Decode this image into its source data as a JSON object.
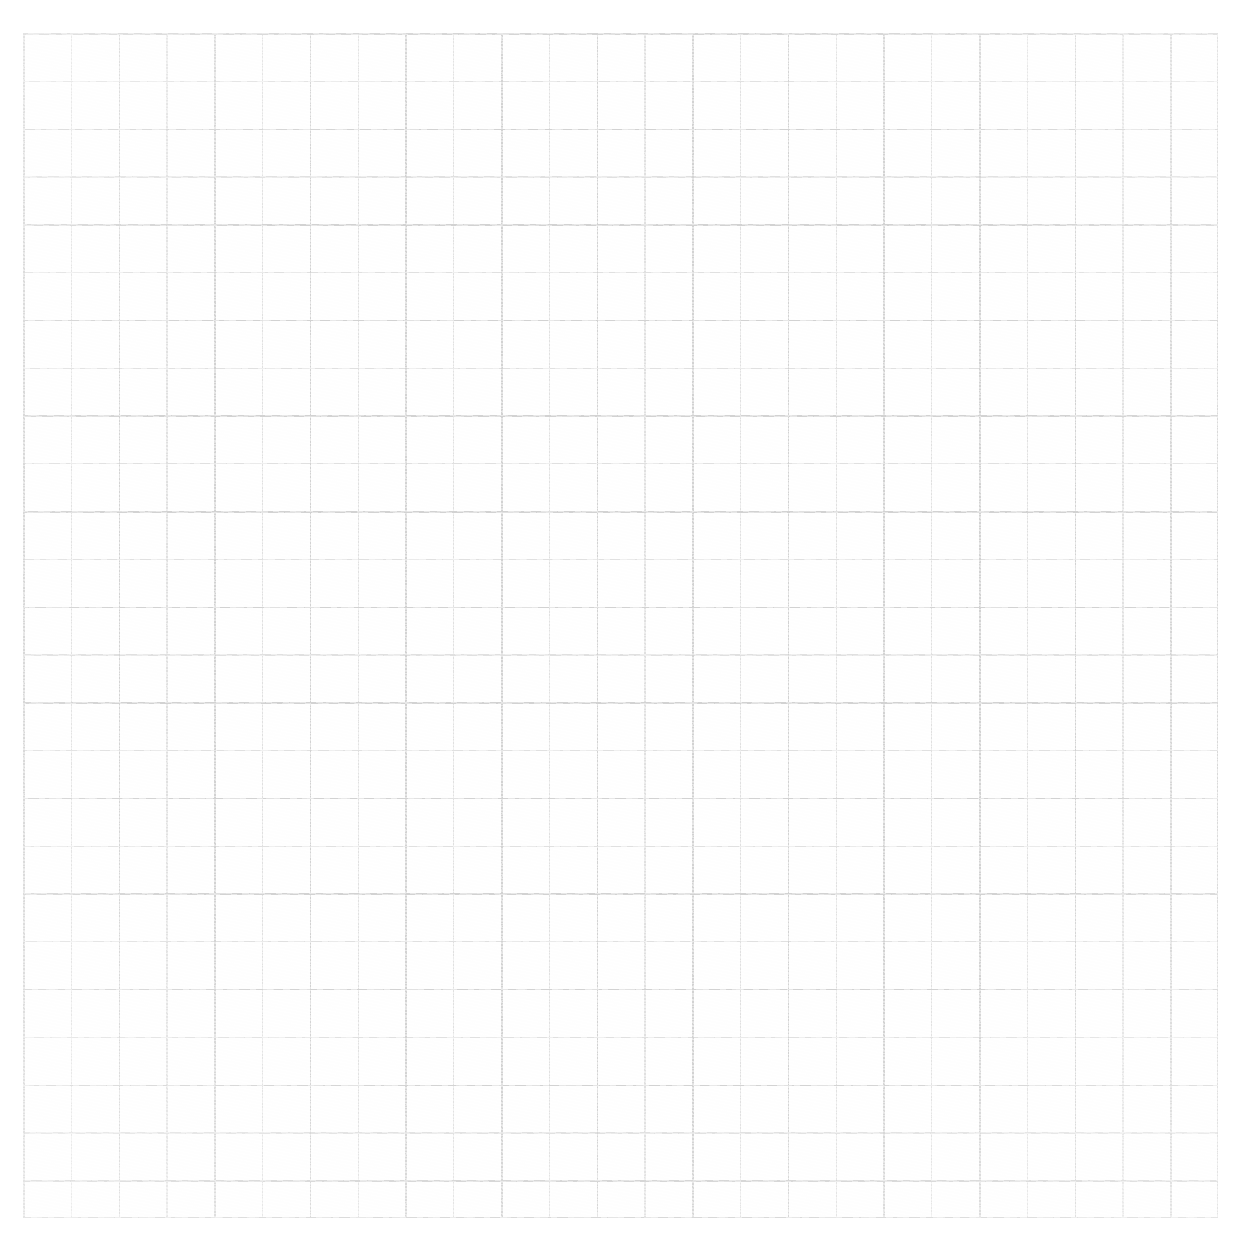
{
  "document": {
    "kind": "scanned-graph-paper",
    "title": "Blank graph paper sheet",
    "description": "A scanned sheet of square-ruled graph paper with no handwriting, drawings or printed text.",
    "background_color": "#ffffff",
    "paper_color": "#fefefe",
    "visible_text": ""
  },
  "grid": {
    "minor_line_color": "#e0e0e0",
    "major_line_color": "#d2d2d2",
    "cell_size_px": 47.8,
    "major_every_cells": 2,
    "block_size_px": 95.6,
    "origin_x_px": 23,
    "origin_y_px": 33,
    "width_px": 1195,
    "height_px": 1185,
    "columns": 25,
    "rows": 25,
    "line_style": "solid",
    "texture": "photocopy-scan"
  },
  "margins": {
    "top_px": 33,
    "left_px": 23,
    "right_px": 22,
    "bottom_px": 20
  },
  "chart_data": {
    "type": "table",
    "title": "",
    "xlabel": "",
    "ylabel": "",
    "categories": [],
    "values": [],
    "annotations": [],
    "grid": true,
    "legend": "none",
    "note": "Empty square-ruled grid: no plotted data, labels, ticks or legend are present in the image."
  }
}
